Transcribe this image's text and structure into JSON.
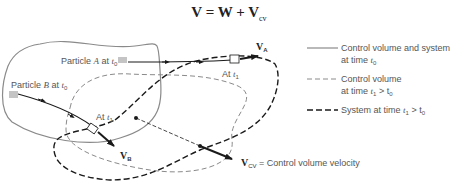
{
  "equation": {
    "lhs": "V",
    "eq": " = ",
    "w": "W",
    "plus": " + ",
    "v": "V",
    "sub": "cv"
  },
  "diagram": {
    "particle_a_label": "Particle ",
    "particle_a_var": "A",
    "particle_a_at": " at ",
    "particle_a_time": "t",
    "particle_a_time_sub": "0",
    "particle_b_label": "Particle ",
    "particle_b_var": "B",
    "particle_b_at": " at ",
    "particle_b_time": "t",
    "particle_b_time_sub": "0",
    "at_t1_a": "At ",
    "at_t1_a_time": "t",
    "at_t1_a_sub": "1",
    "at_t1_b": "At ",
    "at_t1_b_time": "t",
    "at_t1_b_sub": "1",
    "va_label": "V",
    "va_sub": "A",
    "vb_label": "V",
    "vb_sub": "B",
    "vcv_label": "V",
    "vcv_sub": "CV",
    "vcv_desc": " = Control volume velocity"
  },
  "legend": {
    "items": [
      {
        "style": "solid",
        "line1": "Control volume and system",
        "line2_prefix": "at time ",
        "line2_var": "t",
        "line2_sub": "0",
        "line2_suffix": ""
      },
      {
        "style": "dashed-thin",
        "line1": "Control volume",
        "line2_prefix": "at time ",
        "line2_var": "t",
        "line2_sub": "1",
        "line2_suffix": " > t",
        "line2_sub2": "0"
      },
      {
        "style": "dashed-bold",
        "line1": "System at time ",
        "line1_var": "t",
        "line1_sub": "1",
        "line1_suffix": " > t",
        "line1_sub2": "0"
      }
    ]
  },
  "colors": {
    "solid_line": "#8a8a8a",
    "cv_dashed": "#8a8a8a",
    "system_dashed": "#1a1a1a",
    "arrow": "#1a1a1a",
    "particle_marker": "#c4c4c4"
  }
}
